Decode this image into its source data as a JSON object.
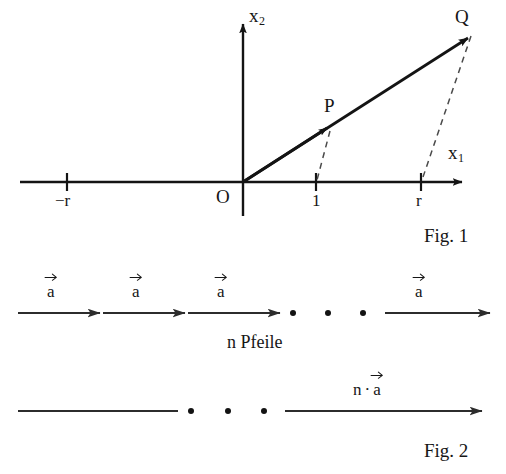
{
  "figure1": {
    "caption": "Fig. 1",
    "axes": {
      "x_axis_label": "x",
      "x_axis_sub": "1",
      "y_axis_label": "x",
      "y_axis_sub": "2"
    },
    "origin_label": "O",
    "points": [
      {
        "name": "P",
        "label": "P"
      },
      {
        "name": "Q",
        "label": "Q"
      }
    ],
    "ticks": [
      {
        "name": "minus-r",
        "label": "−r",
        "x": -1
      },
      {
        "name": "one",
        "label": "1",
        "x": 1
      },
      {
        "name": "r",
        "label": "r",
        "x": 2.35
      }
    ],
    "line_color": "#141414",
    "dash_color": "#4a4a4a"
  },
  "figure2": {
    "caption": "Fig. 2",
    "top_row": {
      "arrow_labels": [
        "a",
        "a",
        "a",
        "a"
      ],
      "ellipsis_dots": 3,
      "under_label": "n Pfeile"
    },
    "bottom_row": {
      "ellipsis_dots": 3,
      "arrow_label_prefix": "n",
      "arrow_label_operator": "·",
      "arrow_label_vector": "a"
    },
    "line_color": "#2c2c2c"
  }
}
